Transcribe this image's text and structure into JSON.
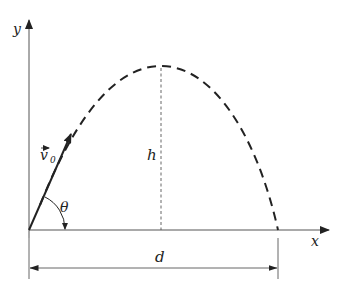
{
  "diagram": {
    "type": "projectile-motion",
    "labels": {
      "y_axis": "y",
      "x_axis": "x",
      "velocity": "v",
      "velocity_subscript": "0",
      "angle": "θ",
      "height": "h",
      "distance": "d"
    },
    "colors": {
      "line": "#222222",
      "axis": "#555555",
      "background": "#ffffff"
    }
  }
}
